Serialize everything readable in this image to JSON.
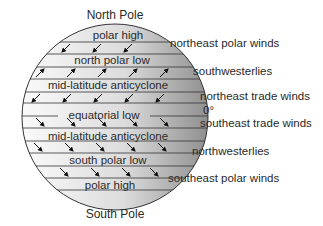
{
  "diagram": {
    "top_label": "North Pole",
    "bottom_label": "South Pole",
    "equator_label": "0°",
    "bands": [
      {
        "label": "polar high",
        "y": 31
      },
      {
        "label": "north polar low",
        "y": 55
      },
      {
        "label": "mid-latitude anticyclone",
        "y": 80
      },
      {
        "label": "equatorial low",
        "y": 104
      },
      {
        "label": "mid-latitude anticyclone",
        "y": 129
      },
      {
        "label": "south polar low",
        "y": 154
      },
      {
        "label": "polar high",
        "y": 178
      }
    ],
    "winds": [
      {
        "label": "northeast polar winds",
        "x": 172,
        "y": 40
      },
      {
        "label": "southwesterlies",
        "x": 192,
        "y": 66
      },
      {
        "label": "northeast trade winds",
        "x": 200,
        "y": 91
      },
      {
        "label": "southeast trade winds",
        "x": 200,
        "y": 116
      },
      {
        "label": "northwesterlies",
        "x": 192,
        "y": 142
      },
      {
        "label": "southeast polar winds",
        "x": 168,
        "y": 168
      }
    ],
    "colors": {
      "globe_light": "#f2f2f2",
      "globe_dark": "#9a9a9a",
      "line": "#333333",
      "text": "#2a2a2a"
    }
  }
}
